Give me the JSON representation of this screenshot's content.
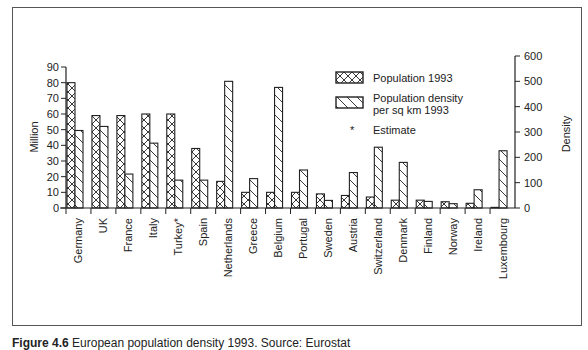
{
  "caption": {
    "figure_label": "Figure 4.6",
    "text": "European population density 1993. Source: Eurostat"
  },
  "chart_data": {
    "type": "bar",
    "title": "",
    "categories": [
      "Germany",
      "UK",
      "France",
      "Italy",
      "Turkey*",
      "Spain",
      "Netherlands",
      "Greece",
      "Belgium",
      "Portugal",
      "Sweden",
      "Austria",
      "Switzerland",
      "Denmark",
      "Finland",
      "Norway",
      "Ireland",
      "Luxembourg"
    ],
    "series": [
      {
        "name": "Population 1993",
        "axis": "left",
        "pattern": "crosshatch",
        "values": [
          80,
          59,
          59,
          60,
          60,
          38,
          17,
          10,
          10,
          10,
          9,
          8,
          7,
          5,
          5,
          4,
          3,
          0.4
        ]
      },
      {
        "name": "Population density per sq km 1993",
        "axis": "right",
        "pattern": "diagonal",
        "values": [
          306,
          322,
          134,
          256,
          110,
          110,
          500,
          116,
          476,
          150,
          30,
          140,
          240,
          180,
          26,
          17,
          72,
          226
        ]
      }
    ],
    "annotations": [
      "* Estimate"
    ],
    "xlabel": "",
    "ylabel": "Million",
    "ylabel_right": "Density",
    "ylim": [
      0,
      90
    ],
    "ylim_right": [
      0,
      600
    ],
    "yticks": [
      0,
      10,
      20,
      30,
      40,
      50,
      60,
      70,
      80,
      90
    ],
    "yticks_right": [
      0,
      100,
      200,
      300,
      400,
      500,
      600
    ],
    "grid": false,
    "legend_position": "upper right inside",
    "legend": [
      {
        "label_lines": [
          "Population 1993"
        ],
        "pattern": "crosshatch"
      },
      {
        "label_lines": [
          "Population density",
          "per sq km 1993"
        ],
        "pattern": "diagonal"
      },
      {
        "label_lines": [
          "Estimate"
        ],
        "pattern": "asterisk"
      }
    ]
  }
}
